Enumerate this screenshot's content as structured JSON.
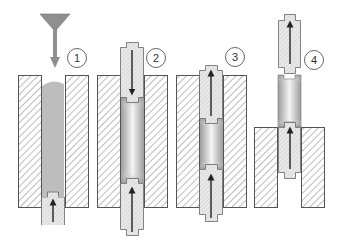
{
  "diagram": {
    "type": "process-sequence",
    "steps": [
      {
        "label": "1",
        "stage": "powder filling",
        "upper_punch": "none",
        "lower_punch_direction": "up"
      },
      {
        "label": "2",
        "stage": "compaction",
        "upper_punch_direction": "down",
        "lower_punch_direction": "up"
      },
      {
        "label": "3",
        "stage": "release upper punch",
        "upper_punch_direction": "up",
        "lower_punch_direction": "up"
      },
      {
        "label": "4",
        "stage": "ejection",
        "upper_punch_direction": "up",
        "lower_punch_direction": "up"
      }
    ],
    "colors": {
      "outline": "#555555",
      "hatch": "#777777",
      "powder": "#bdbdbd",
      "compact_dark": "#9a9a9a",
      "compact_light": "#f2f2f2",
      "punch_fill": "#e6e6e6",
      "arrow": "#222222",
      "funnel": "#8f8f8f"
    }
  }
}
